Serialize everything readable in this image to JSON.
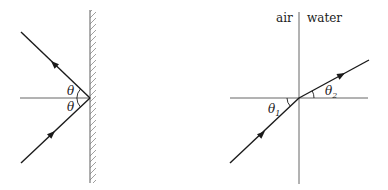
{
  "reflection": {
    "angle_top": "θ",
    "angle_bottom": "θ"
  },
  "refraction": {
    "medium_left": "air",
    "medium_right": "water",
    "angle_incident": "θ",
    "angle_incident_sub": "1",
    "angle_refracted": "θ",
    "angle_refracted_sub": "2"
  },
  "colors": {
    "ray": "#1a1a1a",
    "normal": "#555555",
    "mirror": "#777777"
  }
}
